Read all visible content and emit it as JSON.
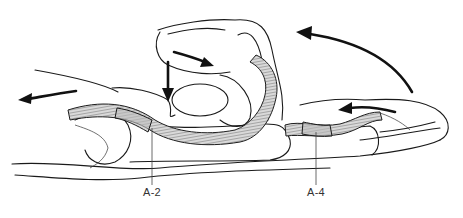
{
  "figure": {
    "labels": [
      {
        "id": "a2",
        "text": "A-2",
        "x": 143,
        "y": 186
      },
      {
        "id": "a4",
        "text": "A-4",
        "x": 307,
        "y": 186
      }
    ],
    "arrows": [
      {
        "name": "proximal-pull-arrow",
        "direction": "left"
      },
      {
        "name": "downward-force-arrow",
        "direction": "down"
      },
      {
        "name": "bowstring-arrow",
        "direction": "down-right"
      },
      {
        "name": "flexion-arc-arrow",
        "direction": "counter-clockwise"
      },
      {
        "name": "distal-tendon-arrow",
        "direction": "left"
      }
    ],
    "colors": {
      "line": "#1a1a1a",
      "tendon_fill": "#d9d9d9",
      "pulley_fill": "#bdbdbd",
      "background": "#ffffff"
    }
  }
}
